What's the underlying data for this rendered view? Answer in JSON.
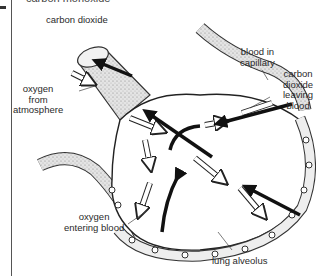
{
  "header": {
    "cut_off_title": "carbon monoxide"
  },
  "labels": {
    "carbon_dioxide_top": "carbon dioxide",
    "blood_in_capillary": [
      "blood in",
      "capillary"
    ],
    "co2_leaving_blood": [
      "carbon",
      "dioxide",
      "leaving",
      "blood"
    ],
    "oxygen_from_atmosphere": [
      "oxygen",
      "from",
      "atmosphere"
    ],
    "oxygen_entering_blood": [
      "oxygen",
      "entering blood"
    ],
    "lung_alveolus": "lung alveolus"
  },
  "legend": {
    "white_arrow": "oxygen",
    "black_arrow": "carbon dioxide"
  },
  "colors": {
    "ink": "#222222",
    "vessel_fill": "#d9d9d9",
    "background": "#ffffff"
  }
}
